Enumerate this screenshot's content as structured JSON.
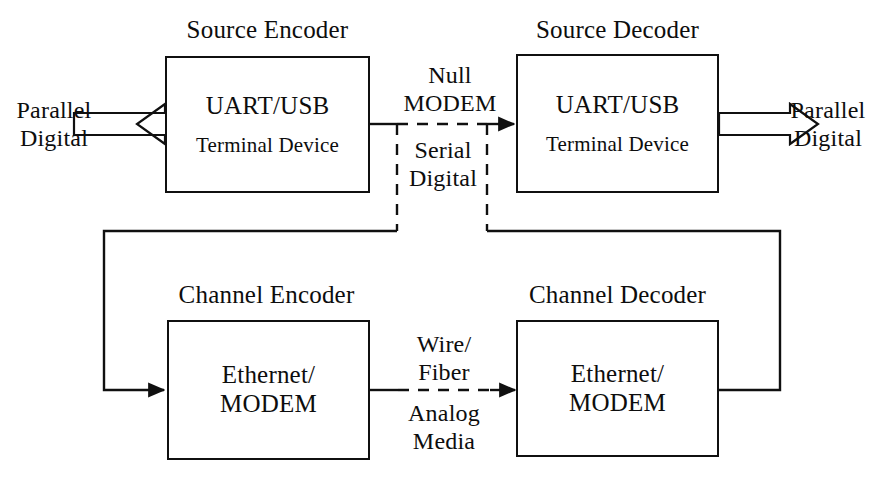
{
  "diagram": {
    "title_text": "Communication system block diagram",
    "stroke_color": "#101010",
    "background_color": "#ffffff",
    "blocks": [
      {
        "id": "source-encoder",
        "caption": "Source Encoder",
        "line1": "UART/USB",
        "line2": "Terminal Device"
      },
      {
        "id": "source-decoder",
        "caption": "Source Decoder",
        "line1": "UART/USB",
        "line2": "Terminal Device"
      },
      {
        "id": "channel-encoder",
        "caption": "Channel Encoder",
        "line1": "Ethernet/",
        "line2": "MODEM"
      },
      {
        "id": "channel-decoder",
        "caption": "Channel Decoder",
        "line1": "Ethernet/",
        "line2": "MODEM"
      }
    ],
    "labels": {
      "input_line1": "Parallel",
      "input_line2": "Digital",
      "output_line1": "Parallel",
      "output_line2": "Digital",
      "null_modem_line1": "Null",
      "null_modem_line2": "MODEM",
      "serial_line1": "Serial",
      "serial_line2": "Digital",
      "wire_line1": "Wire/",
      "wire_line2": "Fiber",
      "analog_line1": "Analog",
      "analog_line2": "Media"
    }
  }
}
